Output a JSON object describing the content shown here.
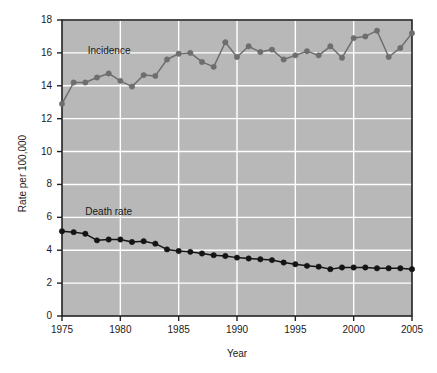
{
  "chart_data": {
    "type": "line",
    "title": "",
    "xlabel": "Year",
    "ylabel": "Rate per 100,000",
    "xlim": [
      1975,
      2005
    ],
    "ylim": [
      0,
      18
    ],
    "xticks": [
      1975,
      1980,
      1985,
      1990,
      1995,
      2000,
      2005
    ],
    "yticks": [
      0,
      2,
      4,
      6,
      8,
      10,
      12,
      14,
      16,
      18
    ],
    "grid": true,
    "legend_position": "inline-labels",
    "plot_background": "#b8b8b8",
    "gridline_color": "#ffffff",
    "x": [
      1975,
      1976,
      1977,
      1978,
      1979,
      1980,
      1981,
      1982,
      1983,
      1984,
      1985,
      1986,
      1987,
      1988,
      1989,
      1990,
      1991,
      1992,
      1993,
      1994,
      1995,
      1996,
      1997,
      1998,
      1999,
      2000,
      2001,
      2002,
      2003,
      2004,
      2005
    ],
    "series": [
      {
        "name": "Incidence",
        "color": "#6e6e6e",
        "marker": "circle",
        "values": [
          12.9,
          14.2,
          14.2,
          14.5,
          14.75,
          14.3,
          13.95,
          14.65,
          14.6,
          15.6,
          15.95,
          16.0,
          15.45,
          15.15,
          16.65,
          15.75,
          16.4,
          16.05,
          16.2,
          15.6,
          15.85,
          16.1,
          15.85,
          16.4,
          15.7,
          16.9,
          17.0,
          17.35,
          15.75,
          16.3,
          17.2
        ]
      },
      {
        "name": "Death rate",
        "color": "#141414",
        "marker": "circle",
        "values": [
          5.15,
          5.1,
          5.0,
          4.6,
          4.65,
          4.65,
          4.5,
          4.55,
          4.4,
          4.05,
          3.95,
          3.9,
          3.8,
          3.7,
          3.65,
          3.55,
          3.5,
          3.45,
          3.4,
          3.25,
          3.15,
          3.05,
          3.0,
          2.85,
          2.95,
          2.95,
          2.95,
          2.9,
          2.9,
          2.9,
          2.85
        ]
      }
    ],
    "annotations": [
      {
        "text": "Incidence",
        "x": 1977.2,
        "y": 16.05
      },
      {
        "text": "Death rate",
        "x": 1977.0,
        "y": 6.25
      }
    ]
  }
}
